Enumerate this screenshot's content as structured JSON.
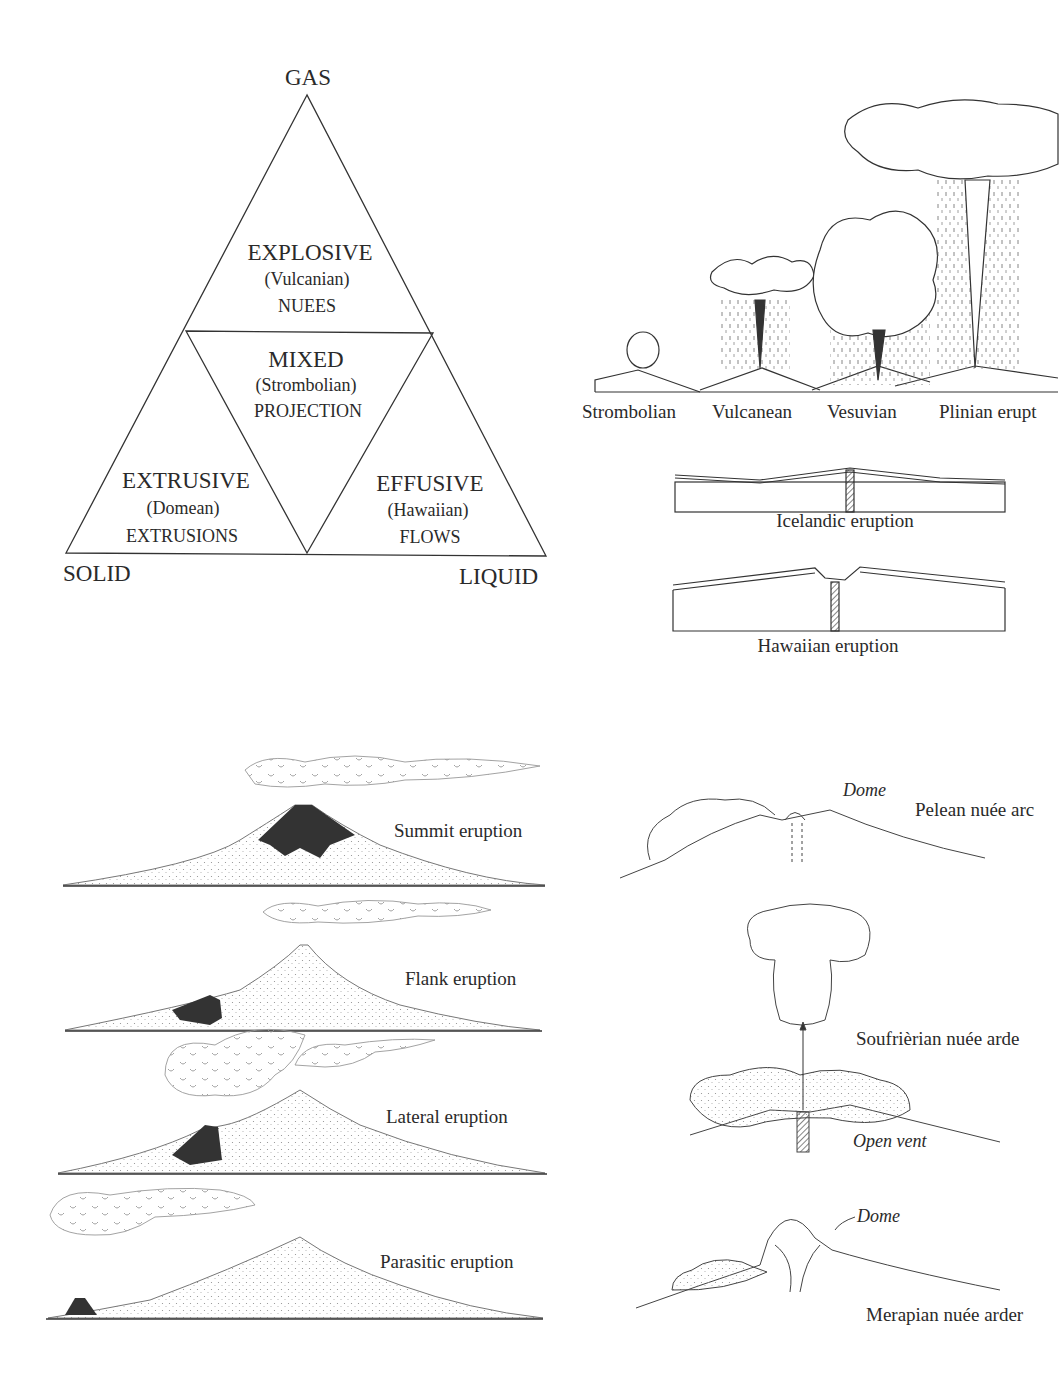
{
  "triangle": {
    "vertices": {
      "top": "GAS",
      "bottom_left": "SOLID",
      "bottom_right": "LIQUID"
    },
    "regions": [
      {
        "title": "EXPLOSIVE",
        "type": "(Vulcanian)",
        "product": "NUEES"
      },
      {
        "title": "MIXED",
        "type": "(Strombolian)",
        "product": "PROJECTION"
      },
      {
        "title": "EXTRUSIVE",
        "type": "(Domean)",
        "product": "EXTRUSIONS"
      },
      {
        "title": "EFFUSIVE",
        "type": "(Hawaiian)",
        "product": "FLOWS"
      }
    ]
  },
  "plume_sequence": {
    "labels": [
      "Strombolian",
      "Vulcanean",
      "Vesuvian",
      "Plinian erupt"
    ]
  },
  "fissure_sections": [
    {
      "label": "Icelandic eruption"
    },
    {
      "label": "Hawaiian eruption"
    }
  ],
  "vent_location_types": [
    {
      "label": "Summit eruption"
    },
    {
      "label": "Flank eruption"
    },
    {
      "label": "Lateral eruption"
    },
    {
      "label": "Parasitic eruption"
    }
  ],
  "nuee_ardente_types": [
    {
      "label": "Pelean nuée arc",
      "annotation": "Dome"
    },
    {
      "label": "Soufrièrian nuée arde",
      "annotation": "Open vent"
    },
    {
      "label": "Merapian nuée arder",
      "annotation": "Dome"
    }
  ],
  "colors": {
    "ink": "#2a2a2a",
    "lava": "#333333",
    "stipple": "#9a9a9a",
    "background": "#ffffff"
  }
}
